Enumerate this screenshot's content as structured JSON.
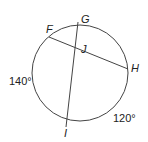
{
  "diagram": {
    "type": "circle-with-intersecting-chords",
    "circle": {
      "cx": 80,
      "cy": 73,
      "r": 48
    },
    "points": {
      "F": {
        "label": "F",
        "x": 49,
        "y": 37
      },
      "G": {
        "label": "G",
        "x": 78,
        "y": 25
      },
      "H": {
        "label": "H",
        "x": 128,
        "y": 69
      },
      "I": {
        "label": "I",
        "x": 67,
        "y": 120
      },
      "J": {
        "label": "J"
      }
    },
    "chords": [
      {
        "from": "F",
        "to": "H"
      },
      {
        "from": "G",
        "to": "I"
      }
    ],
    "arcs": [
      {
        "label": "140°",
        "between": [
          "F",
          "I"
        ]
      },
      {
        "label": "120°",
        "between": [
          "I",
          "H"
        ]
      }
    ]
  }
}
